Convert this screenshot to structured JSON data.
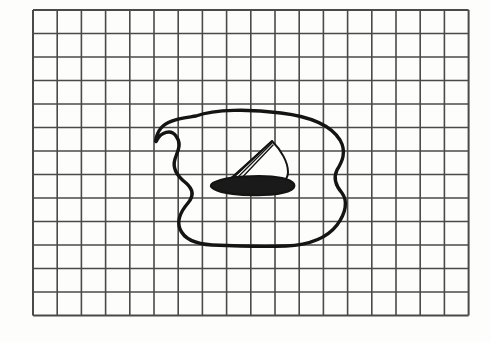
{
  "scene": {
    "title": "Hand-drawn sailboat on a pond sketched on graph paper",
    "kind": "pencil-sketch-on-grid-paper",
    "width": 491,
    "height": 342
  },
  "colors": {
    "page_background": "#ffffff",
    "paper_background": "#fdfdfc",
    "grid_line": "#4a4a4a",
    "grid_line_light": "#5a5a5a",
    "ink": "#141414",
    "hull_fill": "#1a1a1a",
    "sail_fill": "#fdfdfc"
  },
  "grid": {
    "label": "graph-paper-grid",
    "origin_x": 33,
    "origin_y": 10,
    "columns": 18,
    "rows": 13,
    "cell_width": 24.2,
    "cell_height": 23.5,
    "line_width": 1.6,
    "border_line_width": 2.0,
    "right_edge": 468,
    "bottom_edge": 316
  },
  "drawing": {
    "pond": {
      "label": "pond-outline",
      "description": "closed irregular blob with an S-shaped concave indentation on the left side",
      "stroke_width": 3.4,
      "bounds": {
        "left": 156,
        "top": 109,
        "right": 346,
        "bottom": 246
      },
      "path": "M 196 116 C 215 109, 250 109, 281 113 C 306 116, 330 124, 340 140 C 347 152, 342 162, 337 170 C 333 178, 336 186, 342 193 C 348 201, 346 213, 337 225 C 327 238, 308 245, 286 246 C 262 247, 234 246, 212 245 C 196 244, 184 239, 180 229 C 176 219, 182 210, 188 203 C 194 196, 193 189, 186 183 C 177 176, 172 168, 175 159 C 178 150, 182 144, 176 136 C 171 129, 161 132, 157 140 C 154 146, 156 132, 163 126 C 171 119, 184 118, 196 116 Z"
    },
    "boat": {
      "label": "sailboat",
      "hull": {
        "label": "boat-hull",
        "description": "flattened dark lens-shaped hull",
        "path": "M 213 183 C 222 178, 240 176, 259 176 C 277 176, 291 179, 294 184 C 297 190, 285 194, 263 195 C 240 196, 221 193, 214 189 C 210 187, 210 185, 213 183 Z",
        "stroke_width": 2.2
      },
      "mast": {
        "label": "mast",
        "description": "mast leaning right from hull to sail peak",
        "x1": 222,
        "y1": 186,
        "x2": 272,
        "y2": 141,
        "stroke_width": 1.6
      },
      "sail": {
        "label": "sail",
        "description": "triangular sail with curved leech, peak at top",
        "path": "M 272 141 C 281 150, 288 162, 288 172 C 288 179, 283 184, 272 186 L 224 186 Z",
        "stroke_width": 2.0
      },
      "rigging_lines": [
        {
          "label": "rigging-line-1",
          "x1": 224,
          "y1": 186,
          "x2": 271,
          "y2": 142
        },
        {
          "label": "rigging-line-2",
          "x1": 229,
          "y1": 186,
          "x2": 272,
          "y2": 143
        },
        {
          "label": "rigging-line-3",
          "x1": 234,
          "y1": 186,
          "x2": 273,
          "y2": 145
        },
        {
          "label": "boom-line",
          "x1": 218,
          "y1": 184,
          "x2": 290,
          "y2": 183
        }
      ]
    }
  }
}
